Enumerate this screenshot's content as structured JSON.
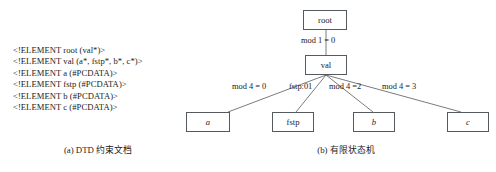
{
  "figure": {
    "background_color": "#ffffff",
    "line_color": "#555a5f",
    "text_color": "#1b1b1b"
  },
  "panel_a": {
    "caption": "(a) DTD 约束文档",
    "dtd_lines": [
      "<!ELEMENT root (val*)>",
      "<!ELEMENT val (a*, fstp*, b*, c*)>",
      "<!ELEMENT a (#PCDATA)>",
      "<!ELEMENT fstp (#PCDATA)>",
      "<!ELEMENT b (#PCDATA)>",
      "<!ELEMENT c (#PCDATA)>"
    ]
  },
  "panel_b": {
    "caption": "(b) 有限状态机",
    "nodes": [
      {
        "id": "root",
        "label": "root",
        "italic": false
      },
      {
        "id": "val",
        "label": "val",
        "italic": false
      },
      {
        "id": "a",
        "label": "a",
        "italic": true
      },
      {
        "id": "fstp",
        "label": "fstp",
        "italic": false
      },
      {
        "id": "b",
        "label": "b",
        "italic": true
      },
      {
        "id": "c",
        "label": "c",
        "italic": true
      }
    ],
    "edges": [
      {
        "from": "root",
        "to": "val",
        "label": "mod 1 = 0"
      },
      {
        "from": "val",
        "to": "a",
        "label": "mod 4 = 0"
      },
      {
        "from": "val",
        "to": "fstp",
        "label": "fstp:01"
      },
      {
        "from": "val",
        "to": "b",
        "label": "mod 4 =2"
      },
      {
        "from": "val",
        "to": "c",
        "label": "mod 4 = 3"
      }
    ]
  }
}
